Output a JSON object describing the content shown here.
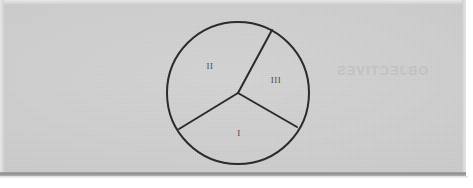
{
  "document": {
    "kind": "scanned-worksheet-figure",
    "background_color": "#cbcbcb",
    "ink_color": "#2b2b2b"
  },
  "figure": {
    "name": "circle-divided-into-three-sectors",
    "shape": "circle",
    "center": {
      "x": 238,
      "y": 93
    },
    "radius": 71,
    "stroke_color": "#2b2b2b",
    "stroke_width": 2,
    "sectors": [
      {
        "label": "I",
        "label_position": {
          "x": 239,
          "y": 133
        },
        "boundary_angles_deg": [
          -30,
          211
        ]
      },
      {
        "label": "II",
        "label_position": {
          "x": 210,
          "y": 66
        },
        "boundary_angles_deg": [
          211,
          62
        ]
      },
      {
        "label": "III",
        "label_position": {
          "x": 276,
          "y": 80
        },
        "boundary_angles_deg": [
          62,
          -30
        ]
      }
    ],
    "radii": [
      {
        "name": "radius-upper-right",
        "angle_deg": 62,
        "endpoint": {
          "x": 272,
          "y": 30
        }
      },
      {
        "name": "radius-lower-left",
        "angle_deg": 211,
        "endpoint": {
          "x": 179,
          "y": 129
        }
      },
      {
        "name": "radius-lower-right",
        "angle_deg": -30,
        "endpoint": {
          "x": 297,
          "y": 127
        }
      }
    ]
  },
  "bleed_through": {
    "heading": "OBJECTIVES",
    "line_1": "",
    "mark": ""
  }
}
